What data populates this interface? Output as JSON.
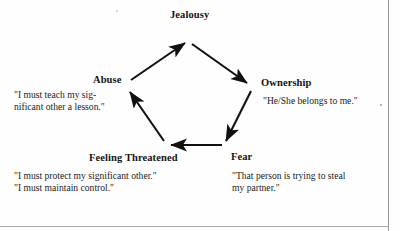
{
  "diagram": {
    "type": "cycle-diagram",
    "shape": "pentagon",
    "nodes": [
      {
        "id": "jealousy",
        "label": "Jealousy",
        "quotes": []
      },
      {
        "id": "ownership",
        "label": "Ownership",
        "quotes": [
          "\"He/She belongs to me.\""
        ]
      },
      {
        "id": "fear",
        "label": "Fear",
        "quotes": [
          "\"That person is trying to steal",
          "my partner.\""
        ]
      },
      {
        "id": "feeling-threatened",
        "label": "Feeling Threatened",
        "quotes": [
          "\"I must protect my significant other.\"",
          "\"I must maintain control.\""
        ]
      },
      {
        "id": "abuse",
        "label": "Abuse",
        "quotes": [
          "\"I must teach my sig-",
          "nificant other a lesson.\""
        ]
      }
    ],
    "edges": [
      {
        "from": "jealousy",
        "to": "ownership"
      },
      {
        "from": "ownership",
        "to": "fear"
      },
      {
        "from": "fear",
        "to": "feeling-threatened"
      },
      {
        "from": "feeling-threatened",
        "to": "abuse"
      },
      {
        "from": "abuse",
        "to": "jealousy"
      }
    ],
    "colors": {
      "ink": "#141414",
      "arrow": "#111111",
      "background": "#ffffff",
      "page_edge": "#9a9a9a"
    }
  }
}
